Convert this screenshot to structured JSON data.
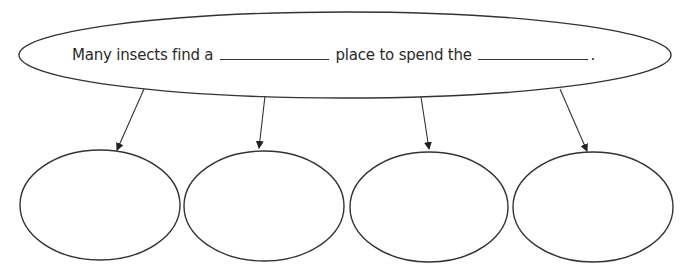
{
  "diagram": {
    "type": "graphic-organizer",
    "main_idea": {
      "text_before": "Many insects find a",
      "text_middle": "place to spend the",
      "text_end": ".",
      "blanks": [
        "",
        ""
      ]
    },
    "detail_boxes": [
      {
        "text": ""
      },
      {
        "text": ""
      },
      {
        "text": ""
      },
      {
        "text": ""
      }
    ],
    "colors": {
      "stroke": "#333333",
      "background": "#ffffff",
      "text": "#2a2a2a"
    }
  }
}
